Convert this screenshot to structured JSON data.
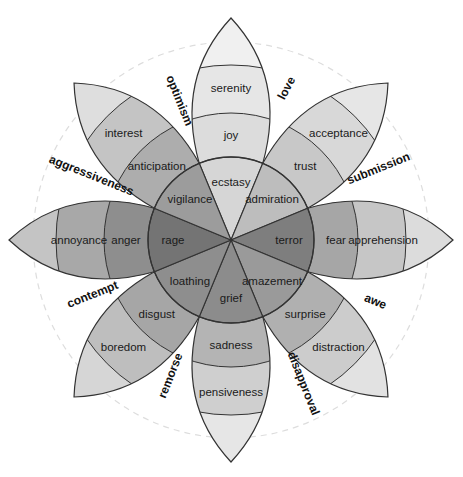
{
  "center": {
    "x": 231,
    "y": 240
  },
  "geometry": {
    "inner_radius": 83,
    "mid_radius": 127,
    "outer_radius": 175,
    "tip_radius": 222,
    "dashed_circle_radius": 198
  },
  "petals": [
    {
      "axis_deg": -90,
      "inner": "ecstasy",
      "middle": "joy",
      "outer": "serenity",
      "shades": [
        "#d6d6d6",
        "#dcdcdc",
        "#e6e6e6",
        "#f0f0f0"
      ]
    },
    {
      "axis_deg": -45,
      "inner": "admiration",
      "middle": "trust",
      "outer": "acceptance",
      "shades": [
        "#bdbdbd",
        "#c8c8c8",
        "#d8d8d8",
        "#e6e6e6"
      ]
    },
    {
      "axis_deg": 0,
      "inner": "terror",
      "middle": "fear",
      "outer": "apprehension",
      "shades": [
        "#7e7e7e",
        "#a6a6a6",
        "#c6c6c6",
        "#dcdcdc"
      ]
    },
    {
      "axis_deg": 45,
      "inner": "amazement",
      "middle": "surprise",
      "outer": "distraction",
      "shades": [
        "#9a9a9a",
        "#b0b0b0",
        "#cccccc",
        "#e2e2e2"
      ]
    },
    {
      "axis_deg": 90,
      "inner": "grief",
      "middle": "sadness",
      "outer": "pensiveness",
      "shades": [
        "#8c8c8c",
        "#b4b4b4",
        "#cfcfcf",
        "#e6e6e6"
      ]
    },
    {
      "axis_deg": 135,
      "inner": "loathing",
      "middle": "disgust",
      "outer": "boredom",
      "shades": [
        "#8e8e8e",
        "#a6a6a6",
        "#bebebe",
        "#d6d6d6"
      ]
    },
    {
      "axis_deg": 180,
      "inner": "rage",
      "middle": "anger",
      "outer": "annoyance",
      "shades": [
        "#747474",
        "#8e8e8e",
        "#a8a8a8",
        "#c4c4c4"
      ]
    },
    {
      "axis_deg": -135,
      "inner": "vigilance",
      "middle": "anticipation",
      "outer": "interest",
      "shades": [
        "#9c9c9c",
        "#adadad",
        "#c4c4c4",
        "#dedede"
      ]
    }
  ],
  "dyads": [
    {
      "label": "love",
      "x": 290,
      "y": 90,
      "rotate": -62
    },
    {
      "label": "submission",
      "x": 380,
      "y": 172,
      "rotate": -22
    },
    {
      "label": "awe",
      "x": 374,
      "y": 305,
      "rotate": 22
    },
    {
      "label": "disapproval",
      "x": 300,
      "y": 385,
      "rotate": 68
    },
    {
      "label": "remorse",
      "x": 174,
      "y": 377,
      "rotate": -68
    },
    {
      "label": "contempt",
      "x": 94,
      "y": 298,
      "rotate": -22
    },
    {
      "label": "aggressiveness",
      "x": 90,
      "y": 179,
      "rotate": 22
    },
    {
      "label": "optimism",
      "x": 176,
      "y": 102,
      "rotate": 68
    }
  ]
}
